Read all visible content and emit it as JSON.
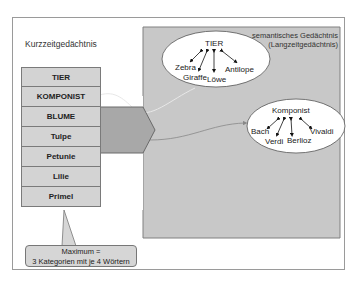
{
  "short_term_memory": {
    "title": "Kurzzeitgedächtnis",
    "items": [
      "TIER",
      "KOMPONIST",
      "BLUME",
      "Tulpe",
      "Petunie",
      "Lilie",
      "Primel"
    ]
  },
  "long_term_memory": {
    "title_line1": "semantisches Gedächtnis",
    "title_line2": "(Langzeitgedächtnis)",
    "categories": [
      {
        "name": "TIER",
        "members": [
          "Zebra",
          "Giraffe",
          "Löwe",
          "Antilope"
        ]
      },
      {
        "name": "Komponist",
        "members": [
          "Bach",
          "Verdi",
          "Berlioz",
          "Vivaldi"
        ]
      }
    ]
  },
  "callout": {
    "line1": "Maximum =",
    "line2": "3 Kategorien mit je 4 Wörtern"
  },
  "colors": {
    "gray_region": "#c8c8c8",
    "stack_fill": "#d3d3d3",
    "arrow_fill": "#a8a8a8",
    "ellipse_fill": "#ffffff"
  }
}
